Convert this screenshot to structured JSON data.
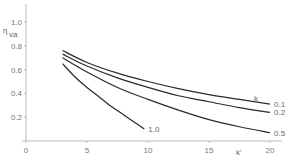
{
  "chart_data": {
    "type": "line",
    "title": "",
    "xlabel": "k'",
    "ylabel": "η_va",
    "xlim": [
      0,
      20
    ],
    "ylim": [
      0,
      1.0
    ],
    "x_ticks": [
      "0",
      "5",
      "10",
      "15",
      "20"
    ],
    "y_ticks": [
      "0.2",
      "0.4",
      "0.6",
      "0.8",
      "1.0"
    ],
    "grid": false,
    "legend_title": "k",
    "series": [
      {
        "name": "0.1",
        "x": [
          3,
          5,
          7.5,
          10,
          12.5,
          15,
          17.5,
          20
        ],
        "y": [
          0.76,
          0.66,
          0.57,
          0.5,
          0.44,
          0.39,
          0.35,
          0.31
        ]
      },
      {
        "name": "0.2",
        "x": [
          3,
          5,
          7.5,
          10,
          12.5,
          15,
          17.5,
          20
        ],
        "y": [
          0.73,
          0.63,
          0.53,
          0.45,
          0.38,
          0.33,
          0.28,
          0.24
        ]
      },
      {
        "name": "0.5",
        "x": [
          3,
          5,
          7.5,
          10,
          12.5,
          15,
          17.5,
          20
        ],
        "y": [
          0.7,
          0.58,
          0.45,
          0.35,
          0.26,
          0.18,
          0.12,
          0.07
        ]
      },
      {
        "name": "1.0",
        "x": [
          3,
          4,
          5,
          6,
          7,
          8,
          9,
          9.7
        ],
        "y": [
          0.65,
          0.54,
          0.45,
          0.37,
          0.29,
          0.22,
          0.15,
          0.1
        ]
      }
    ]
  },
  "labels": {
    "ylabel_main": "η",
    "ylabel_sub": "va",
    "xlabel": "k'",
    "legend_title": "k",
    "curve_labels": [
      "0.1",
      "0.2",
      "0.5",
      "1.0"
    ]
  }
}
